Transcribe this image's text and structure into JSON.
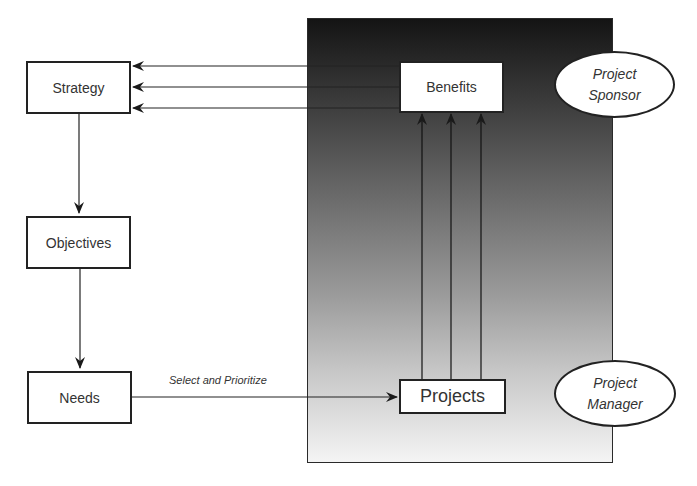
{
  "diagram": {
    "type": "flow",
    "nodes": {
      "strategy": {
        "label": "Strategy"
      },
      "objectives": {
        "label": "Objectives"
      },
      "needs": {
        "label": "Needs"
      },
      "benefits": {
        "label": "Benefits"
      },
      "projects": {
        "label": "Projects"
      }
    },
    "roles": {
      "sponsor": {
        "line1": "Project",
        "line2": "Sponsor"
      },
      "manager": {
        "line1": "Project",
        "line2": "Manager"
      }
    },
    "edges": [
      {
        "from": "benefits",
        "to": "strategy",
        "count": 3
      },
      {
        "from": "strategy",
        "to": "objectives"
      },
      {
        "from": "objectives",
        "to": "needs"
      },
      {
        "from": "needs",
        "to": "projects",
        "label": "Select and Prioritize"
      },
      {
        "from": "projects",
        "to": "benefits",
        "count": 3
      }
    ],
    "edge_labels": {
      "select_prioritize": "Select and Prioritize"
    },
    "colors": {
      "panel_top": "#141414",
      "panel_bottom": "#f4f4f4",
      "stroke": "#222222",
      "box_fill": "#ffffff"
    }
  }
}
